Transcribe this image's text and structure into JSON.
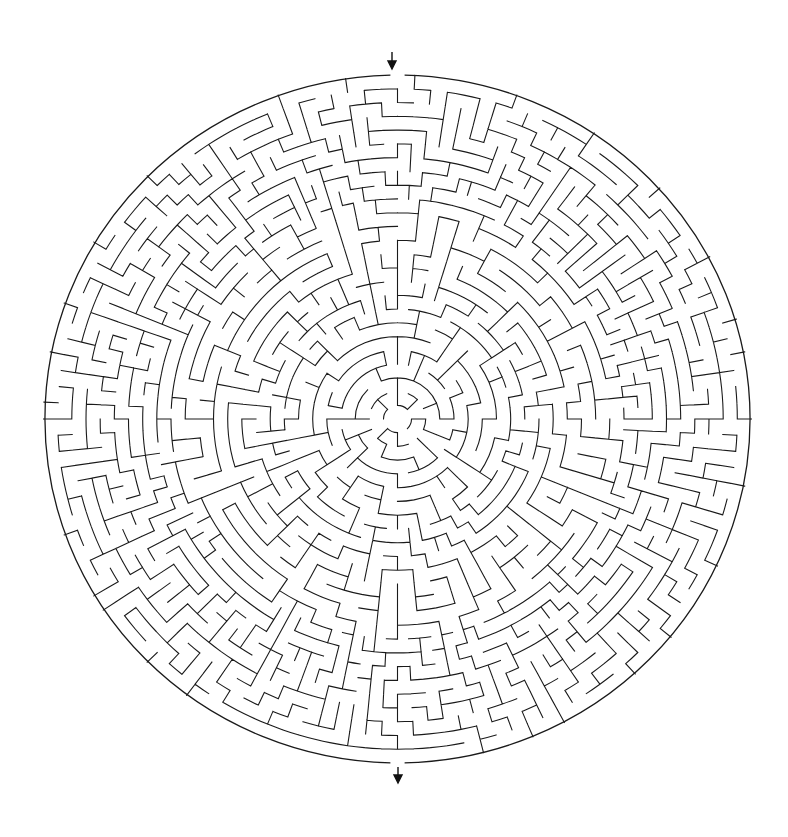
{
  "puzzle": {
    "type": "circular-maze",
    "title": "Circular maze",
    "entrance": {
      "label": "start",
      "position": "top",
      "icon": "arrow-down-icon"
    },
    "exit": {
      "label": "finish",
      "position": "bottom",
      "icon": "arrow-down-icon"
    }
  },
  "geometry": {
    "cx": 397.5,
    "cy": 419,
    "rx": 354,
    "ry": 344,
    "center_radius": 14,
    "rings": 24,
    "seed": 7
  },
  "colors": {
    "background": "#ffffff",
    "wall": "#1a1a1a",
    "arrow": "#111111"
  }
}
